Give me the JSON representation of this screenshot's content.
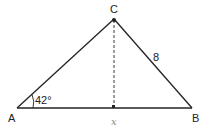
{
  "diagram": {
    "type": "triangle-with-altitude",
    "vertices": {
      "A": {
        "label": "A",
        "x": 17,
        "y": 108
      },
      "B": {
        "label": "B",
        "x": 192,
        "y": 108
      },
      "C": {
        "label": "C",
        "x": 114,
        "y": 19
      }
    },
    "altitude_foot": {
      "x": 114,
      "y": 108
    },
    "labels": {
      "vertex_a": "A",
      "vertex_b": "B",
      "vertex_c": "C",
      "side_cb": "8",
      "angle_a": "42°",
      "base_x": "x"
    },
    "colors": {
      "stroke": "#222222",
      "text": "#222222",
      "faint": "#888888"
    }
  }
}
